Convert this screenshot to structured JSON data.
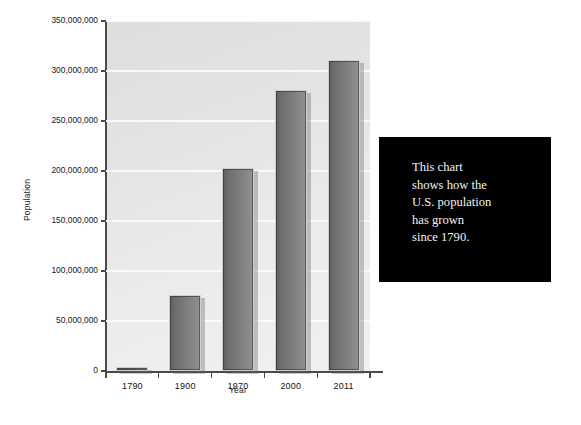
{
  "chart_data": {
    "type": "bar",
    "title": "",
    "xlabel": "Year",
    "ylabel": "Population",
    "categories": [
      "1790",
      "1900",
      "1970",
      "2000",
      "2011"
    ],
    "values": [
      3900000,
      76000000,
      203000000,
      281000000,
      311000000
    ],
    "ylim": [
      0,
      350000000
    ],
    "ytick_values": [
      0,
      50000000,
      100000000,
      150000000,
      200000000,
      250000000,
      300000000,
      350000000
    ],
    "ytick_labels": [
      "0",
      "50,000,000",
      "100,000,000",
      "150,000,000",
      "200,000,000",
      "250,000,000",
      "300,000,000",
      "350,000,000"
    ],
    "grid": true,
    "legend": null,
    "series": [
      {
        "name": "U.S. Population",
        "values": [
          3900000,
          76000000,
          203000000,
          281000000,
          311000000
        ]
      }
    ],
    "annotations": [
      {
        "name": "callout-box",
        "text": "This chart\nshows how the\nU.S. population\nhas grown\nsince 1790.",
        "background": "#000000",
        "color": "#f2f2f2"
      }
    ],
    "colors": {
      "bar_fill_dark": "#5f5f5f",
      "bar_fill_light": "#939393",
      "bar_border": "#cfcfcf",
      "plot_background": "#e8e8e8",
      "gridline": "#fbfbfb",
      "axis": "#4a4a4a",
      "text": "#141414"
    }
  },
  "callout": {
    "text": "This chart\nshows how the\nU.S. population\nhas grown\nsince 1790."
  }
}
